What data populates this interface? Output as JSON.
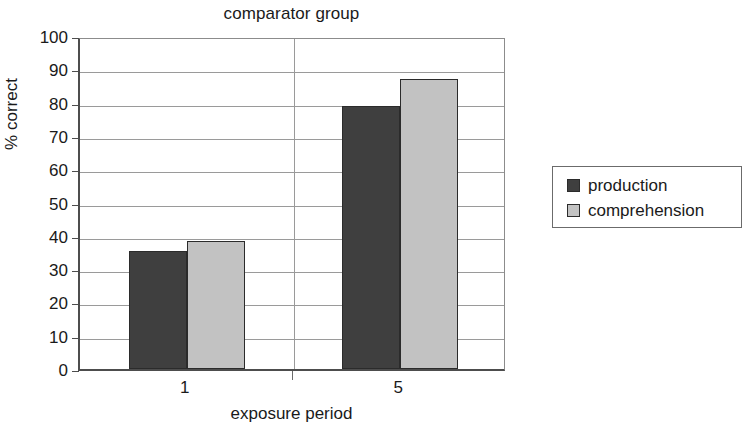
{
  "chart_data": {
    "type": "bar",
    "title": "comparator group",
    "xlabel": "exposure period",
    "ylabel": "% correct",
    "categories": [
      "1",
      "5"
    ],
    "series": [
      {
        "name": "production",
        "values": [
          35.5,
          79
        ],
        "color": "#3f3f3f"
      },
      {
        "name": "comprehension",
        "values": [
          38.5,
          87
        ],
        "color": "#c2c2c2"
      }
    ],
    "ylim": [
      0,
      100
    ],
    "ytick_step": 10,
    "yticks": [
      100,
      90,
      80,
      70,
      60,
      50,
      40,
      30,
      20,
      10,
      0
    ],
    "ytick_labels": [
      "100",
      "90",
      "80",
      "70",
      "60",
      "50",
      "40",
      "30",
      "20",
      "10",
      "0"
    ],
    "grid": true,
    "grid_axis": "y",
    "legend_position": "right",
    "legend_entries": [
      "production",
      "comprehension"
    ],
    "bar_grouping": "grouped-adjacent"
  },
  "legend": {
    "rows": [
      {
        "label": "production"
      },
      {
        "label": "comprehension"
      }
    ]
  }
}
